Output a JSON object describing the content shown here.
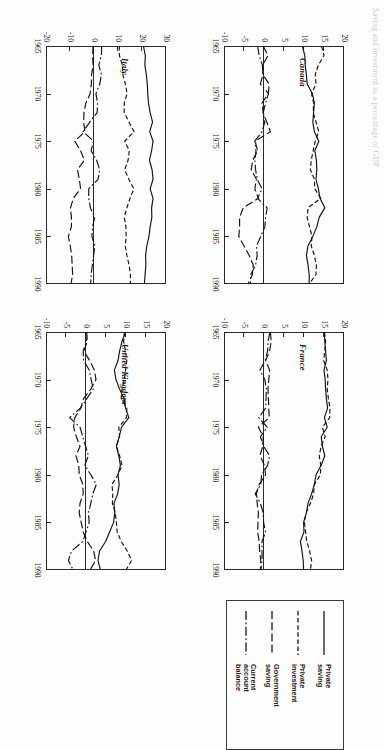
{
  "figure": {
    "caption": "Saving and investment as a percentage of GDP",
    "units": "percent of GDP"
  },
  "legend": {
    "title": "",
    "entries": [
      {
        "label": "Private\nsaving",
        "style": "solid",
        "key": "private_saving"
      },
      {
        "label": "Private\ninvestment",
        "style": "dashed",
        "key": "private_investment"
      },
      {
        "label": "Government\nsaving",
        "style": "longdash",
        "key": "government_saving"
      },
      {
        "label": "Current\naccount\nbalance",
        "style": "dashdot",
        "key": "current_account_balance"
      }
    ]
  },
  "chart_data": [
    {
      "type": "line",
      "title": "Canada",
      "xlabel": "",
      "ylabel": "",
      "grid": false,
      "legend_position": "external-box",
      "xlim": [
        1965,
        1990
      ],
      "ylim": [
        -10,
        20
      ],
      "xticks": [
        1965,
        1970,
        1975,
        1980,
        1985,
        1990
      ],
      "yticks": [
        20,
        15,
        10,
        5,
        0,
        -5,
        -10
      ],
      "ytick_labels": [
        "20",
        "15",
        "10",
        "5",
        "0",
        "-5",
        "-10"
      ],
      "x": [
        1965,
        1966,
        1967,
        1968,
        1969,
        1970,
        1971,
        1972,
        1973,
        1974,
        1975,
        1976,
        1977,
        1978,
        1979,
        1980,
        1981,
        1982,
        1983,
        1984,
        1985,
        1986,
        1987,
        1988,
        1989,
        1990
      ],
      "series": [
        {
          "name": "Private saving",
          "style": "solid",
          "values": [
            9.6,
            10.2,
            10.3,
            10.6,
            10.8,
            12.1,
            12.6,
            12.4,
            12.2,
            12.6,
            13.7,
            12.7,
            13.1,
            13.2,
            13.0,
            13.6,
            14.0,
            15.2,
            13.8,
            13.2,
            12.2,
            11.0,
            10.6,
            11.0,
            11.3,
            11.3
          ]
        },
        {
          "name": "Private investment",
          "style": "dashed",
          "values": [
            14.4,
            15.0,
            13.6,
            12.8,
            13.0,
            11.9,
            12.4,
            12.3,
            13.0,
            13.7,
            12.8,
            12.3,
            11.8,
            11.6,
            12.6,
            12.7,
            14.2,
            11.0,
            10.8,
            11.4,
            12.0,
            11.8,
            12.6,
            13.1,
            13.0,
            11.3
          ]
        },
        {
          "name": "Government saving",
          "style": "longdash",
          "values": [
            -0.2,
            1.0,
            -0.3,
            -0.3,
            1.3,
            1.1,
            -0.5,
            -0.2,
            0.7,
            1.6,
            -2.2,
            -1.6,
            -2.8,
            -3.2,
            -1.9,
            -2.3,
            -1.4,
            -5.2,
            -6.1,
            -6.1,
            -6.3,
            -5.0,
            -3.7,
            -2.7,
            -2.9,
            -4.0
          ]
        },
        {
          "name": "Current account balance",
          "style": "dashdot",
          "values": [
            -1.6,
            -1.2,
            -0.4,
            -0.3,
            -0.9,
            1.1,
            0.4,
            -0.2,
            0.2,
            -0.5,
            -2.3,
            -2.0,
            -2.3,
            -2.1,
            -1.7,
            -0.5,
            -1.6,
            0.8,
            0.4,
            0.2,
            -0.8,
            -1.9,
            -1.7,
            -2.1,
            -3.3,
            -3.4
          ]
        }
      ]
    },
    {
      "type": "line",
      "title": "France",
      "xlabel": "",
      "ylabel": "",
      "grid": false,
      "legend_position": "external-box",
      "xlim": [
        1965,
        1990
      ],
      "ylim": [
        -10,
        20
      ],
      "xticks": [
        1965,
        1970,
        1975,
        1980,
        1985,
        1990
      ],
      "yticks": [
        20,
        15,
        10,
        5,
        0,
        -5,
        -10
      ],
      "ytick_labels": [
        "20",
        "15",
        "10",
        "5",
        "0",
        "-5",
        "-10"
      ],
      "x": [
        1965,
        1966,
        1967,
        1968,
        1969,
        1970,
        1971,
        1972,
        1973,
        1974,
        1975,
        1976,
        1977,
        1978,
        1979,
        1980,
        1981,
        1982,
        1983,
        1984,
        1985,
        1986,
        1987,
        1988,
        1989,
        1990
      ],
      "series": [
        {
          "name": "Private saving",
          "style": "solid",
          "values": [
            15.1,
            15.2,
            15.4,
            15.6,
            15.0,
            15.3,
            15.4,
            15.6,
            15.9,
            15.1,
            15.8,
            14.3,
            14.6,
            15.2,
            14.3,
            13.0,
            12.6,
            11.9,
            11.0,
            10.6,
            9.9,
            10.0,
            9.1,
            9.5,
            9.8,
            9.9
          ]
        },
        {
          "name": "Private investment",
          "style": "dashed",
          "values": [
            15.1,
            15.4,
            15.2,
            14.9,
            15.8,
            16.0,
            15.8,
            16.1,
            16.5,
            16.4,
            14.6,
            15.3,
            14.3,
            13.8,
            14.2,
            14.1,
            12.6,
            12.4,
            11.6,
            10.5,
            10.1,
            10.4,
            10.7,
            11.4,
            11.9,
            11.6
          ]
        },
        {
          "name": "Government saving",
          "style": "longdash",
          "values": [
            1.6,
            1.8,
            1.4,
            0.4,
            1.4,
            1.2,
            1.0,
            1.1,
            1.2,
            1.3,
            -1.4,
            -0.2,
            -0.3,
            -1.0,
            0.1,
            0.4,
            -1.2,
            -1.9,
            -1.7,
            -1.4,
            -1.5,
            -1.6,
            -1.2,
            -1.1,
            -0.8,
            -0.9
          ]
        },
        {
          "name": "Current account balance",
          "style": "dashdot",
          "values": [
            1.5,
            1.0,
            0.9,
            0.3,
            -1.0,
            0.2,
            0.6,
            0.5,
            0.4,
            -1.3,
            0.8,
            -0.9,
            -0.1,
            1.4,
            0.9,
            -0.6,
            -0.8,
            -2.2,
            -0.9,
            -0.2,
            -0.1,
            0.4,
            -0.5,
            -0.5,
            -0.5,
            -0.8
          ]
        }
      ]
    },
    {
      "type": "line",
      "title": "Italy",
      "xlabel": "",
      "ylabel": "",
      "grid": false,
      "legend_position": "external-box",
      "xlim": [
        1965,
        1990
      ],
      "ylim": [
        -20,
        30
      ],
      "xticks": [
        1965,
        1970,
        1975,
        1980,
        1985,
        1990
      ],
      "yticks": [
        30,
        20,
        10,
        0,
        -10,
        -20
      ],
      "ytick_labels": [
        "30",
        "20",
        "10",
        "0",
        "-10",
        "-20"
      ],
      "x": [
        1965,
        1966,
        1967,
        1968,
        1969,
        1970,
        1971,
        1972,
        1973,
        1974,
        1975,
        1976,
        1977,
        1978,
        1979,
        1980,
        1981,
        1982,
        1983,
        1984,
        1985,
        1986,
        1987,
        1988,
        1989,
        1990
      ],
      "series": [
        {
          "name": "Private saving",
          "style": "solid",
          "values": [
            20.6,
            21.4,
            21.2,
            21.8,
            22.2,
            22.4,
            22.7,
            23.4,
            24.4,
            23.2,
            24.6,
            24.0,
            23.1,
            24.2,
            24.6,
            23.4,
            24.6,
            24.0,
            24.1,
            23.4,
            22.9,
            22.0,
            21.5,
            21.6,
            21.3,
            21.0
          ]
        },
        {
          "name": "Private investment",
          "style": "dashed",
          "values": [
            10.5,
            10.6,
            11.8,
            12.0,
            13.1,
            13.8,
            12.6,
            12.6,
            14.6,
            16.7,
            12.8,
            14.7,
            14.2,
            12.8,
            14.5,
            16.6,
            15.0,
            13.7,
            12.6,
            13.3,
            13.4,
            13.0,
            13.7,
            14.6,
            15.2,
            15.1
          ]
        },
        {
          "name": "Government saving",
          "style": "longdash",
          "values": [
            -0.4,
            -0.6,
            -0.4,
            -1.0,
            -1.1,
            -1.6,
            -3.4,
            -4.2,
            -4.3,
            -3.8,
            -8.0,
            -5.6,
            -4.0,
            -6.9,
            -6.1,
            -5.6,
            -8.6,
            -9.8,
            -9.4,
            -9.4,
            -10.7,
            -9.9,
            -9.3,
            -9.1,
            -8.9,
            -9.6
          ]
        },
        {
          "name": "Current account balance",
          "style": "dashdot",
          "values": [
            3.2,
            3.1,
            2.0,
            3.1,
            2.4,
            0.8,
            1.5,
            1.3,
            -1.8,
            -4.5,
            -0.2,
            -1.2,
            1.1,
            2.4,
            1.7,
            -2.2,
            -2.2,
            -1.5,
            0.3,
            -0.6,
            -0.9,
            0.4,
            -0.2,
            -0.7,
            -1.2,
            -1.4
          ]
        }
      ]
    },
    {
      "type": "line",
      "title": "United Kingdom",
      "xlabel": "",
      "ylabel": "",
      "grid": false,
      "legend_position": "external-box",
      "xlim": [
        1965,
        1990
      ],
      "ylim": [
        -10,
        20
      ],
      "xticks": [
        1965,
        1970,
        1975,
        1980,
        1985,
        1990
      ],
      "yticks": [
        20,
        15,
        10,
        5,
        0,
        -5,
        -10
      ],
      "ytick_labels": [
        "20",
        "15",
        "10",
        "5",
        "0",
        "-5",
        "-10"
      ],
      "x": [
        1965,
        1966,
        1967,
        1968,
        1969,
        1970,
        1971,
        1972,
        1973,
        1974,
        1975,
        1976,
        1977,
        1978,
        1979,
        1980,
        1981,
        1982,
        1983,
        1984,
        1985,
        1986,
        1987,
        1988,
        1989,
        1990
      ],
      "series": [
        {
          "name": "Private saving",
          "style": "solid",
          "values": [
            9.9,
            9.0,
            8.4,
            8.0,
            7.1,
            7.5,
            8.4,
            9.5,
            9.9,
            10.7,
            8.9,
            8.3,
            7.6,
            8.2,
            8.6,
            8.0,
            8.3,
            7.9,
            7.0,
            7.2,
            6.9,
            5.9,
            4.9,
            3.4,
            3.0,
            3.6
          ]
        },
        {
          "name": "Private investment",
          "style": "dashed",
          "values": [
            9.6,
            9.4,
            9.9,
            10.2,
            9.9,
            9.6,
            9.0,
            8.8,
            10.2,
            10.1,
            8.2,
            8.4,
            7.6,
            8.4,
            9.0,
            8.0,
            6.5,
            6.7,
            6.6,
            7.3,
            7.6,
            7.8,
            8.8,
            10.3,
            11.4,
            10.0
          ]
        },
        {
          "name": "Government saving",
          "style": "longdash",
          "values": [
            0.2,
            0.3,
            -0.5,
            0.9,
            2.1,
            2.5,
            1.2,
            -0.6,
            -1.3,
            -2.8,
            -3.1,
            -2.4,
            -1.5,
            -2.5,
            -1.8,
            -1.7,
            -0.8,
            -0.7,
            -1.5,
            -1.7,
            -1.2,
            -0.7,
            0.3,
            1.9,
            2.4,
            1.0
          ]
        },
        {
          "name": "Current account balance",
          "style": "dashdot",
          "values": [
            -0.1,
            0.1,
            -0.7,
            -0.6,
            0.8,
            1.3,
            1.8,
            0.2,
            -1.4,
            -4.1,
            -1.5,
            -0.8,
            -0.1,
            0.6,
            -0.3,
            1.2,
            2.6,
            1.7,
            1.2,
            0.6,
            0.8,
            0.0,
            -0.8,
            -3.6,
            -4.4,
            -3.2
          ]
        }
      ]
    }
  ]
}
